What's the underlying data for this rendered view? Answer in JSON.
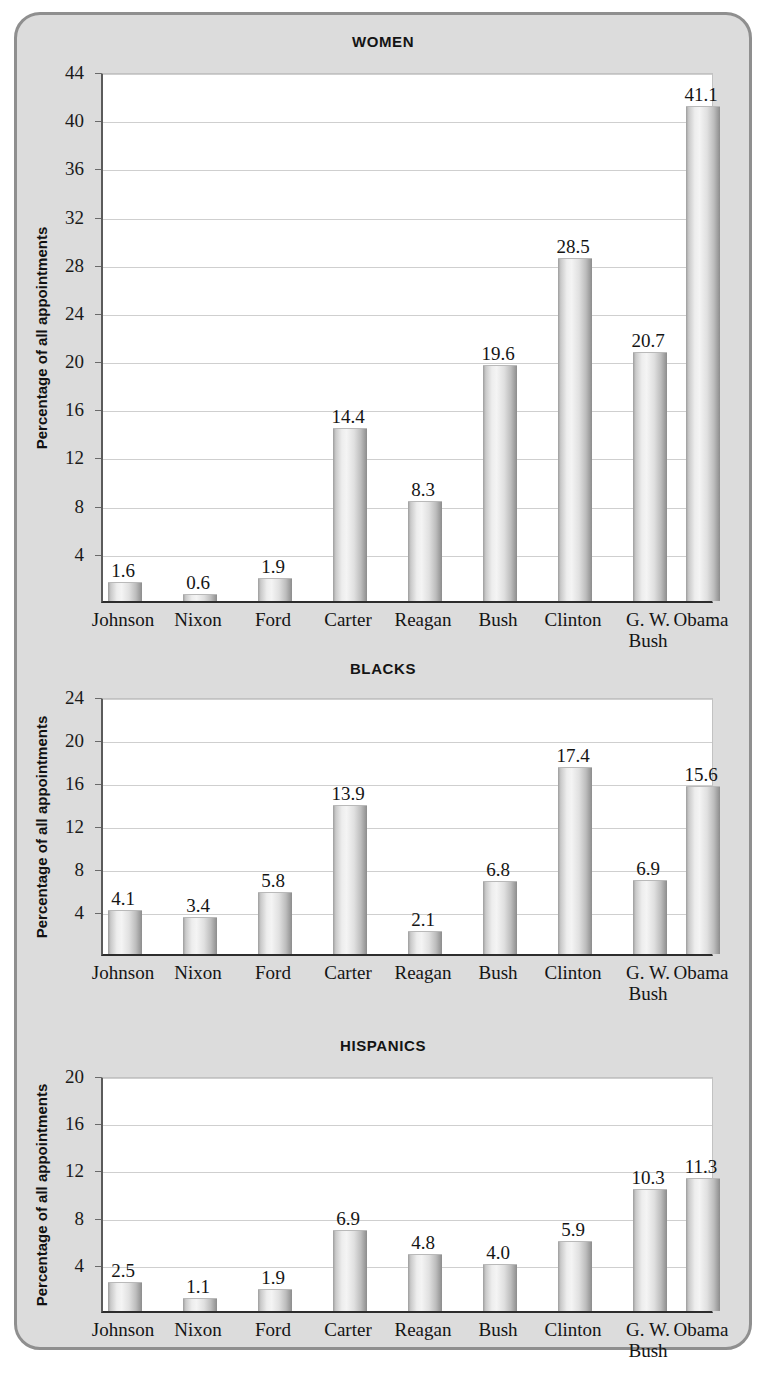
{
  "figure": {
    "background_color": "#dcdcdc",
    "border_color": "#8f8f8f",
    "panel_color": "#ffffff"
  },
  "axis": {
    "ylabel": "Percentage of all appointments"
  },
  "chart_data": [
    {
      "type": "bar",
      "title": "WOMEN",
      "xlabel": "",
      "ylabel": "Percentage of all appointments",
      "categories": [
        "Johnson",
        "Nixon",
        "Ford",
        "Carter",
        "Reagan",
        "Bush",
        "Clinton",
        "G. W. Bush",
        "Obama"
      ],
      "values": [
        1.6,
        0.6,
        1.9,
        14.4,
        8.3,
        19.6,
        28.5,
        20.7,
        41.1
      ],
      "value_labels": [
        "1.6",
        "0.6",
        "1.9",
        "14.4",
        "8.3",
        "19.6",
        "28.5",
        "20.7",
        "41.1"
      ],
      "ylim": [
        0,
        44
      ],
      "yticks": [
        4,
        8,
        12,
        16,
        20,
        24,
        28,
        32,
        36,
        40,
        44
      ],
      "ytick_labels": [
        "4",
        "8",
        "12",
        "16",
        "20",
        "24",
        "28",
        "32",
        "36",
        "40",
        "44"
      ],
      "grid": true,
      "legend": "none"
    },
    {
      "type": "bar",
      "title": "BLACKS",
      "xlabel": "",
      "ylabel": "Percentage of all appointments",
      "categories": [
        "Johnson",
        "Nixon",
        "Ford",
        "Carter",
        "Reagan",
        "Bush",
        "Clinton",
        "G. W. Bush",
        "Obama"
      ],
      "values": [
        4.1,
        3.4,
        5.8,
        13.9,
        2.1,
        6.8,
        17.4,
        6.9,
        15.6
      ],
      "value_labels": [
        "4.1",
        "3.4",
        "5.8",
        "13.9",
        "2.1",
        "6.8",
        "17.4",
        "6.9",
        "15.6"
      ],
      "ylim": [
        0,
        24
      ],
      "yticks": [
        4,
        8,
        12,
        16,
        20,
        24
      ],
      "ytick_labels": [
        "4",
        "8",
        "12",
        "16",
        "20",
        "24"
      ],
      "grid": true,
      "legend": "none"
    },
    {
      "type": "bar",
      "title": "HISPANICS",
      "xlabel": "",
      "ylabel": "Percentage of all appointments",
      "categories": [
        "Johnson",
        "Nixon",
        "Ford",
        "Carter",
        "Reagan",
        "Bush",
        "Clinton",
        "G. W. Bush",
        "Obama"
      ],
      "values": [
        2.5,
        1.1,
        1.9,
        6.9,
        4.8,
        4.0,
        5.9,
        10.3,
        11.3
      ],
      "value_labels": [
        "2.5",
        "1.1",
        "1.9",
        "6.9",
        "4.8",
        "4.0",
        "5.9",
        "10.3",
        "11.3"
      ],
      "ylim": [
        0,
        20
      ],
      "yticks": [
        4,
        8,
        12,
        16,
        20
      ],
      "ytick_labels": [
        "4",
        "8",
        "12",
        "16",
        "20"
      ],
      "grid": true,
      "legend": "none"
    }
  ],
  "layout": {
    "panels": [
      {
        "top": 18,
        "title_top": 18,
        "plot_top": 58,
        "plot_height": 530
      },
      {
        "top": 645,
        "title_top": 645,
        "plot_top": 683,
        "plot_height": 258
      },
      {
        "top": 1022,
        "title_top": 1022,
        "plot_top": 1062,
        "plot_height": 236
      }
    ],
    "plot_left": 84,
    "plot_width": 612
  }
}
